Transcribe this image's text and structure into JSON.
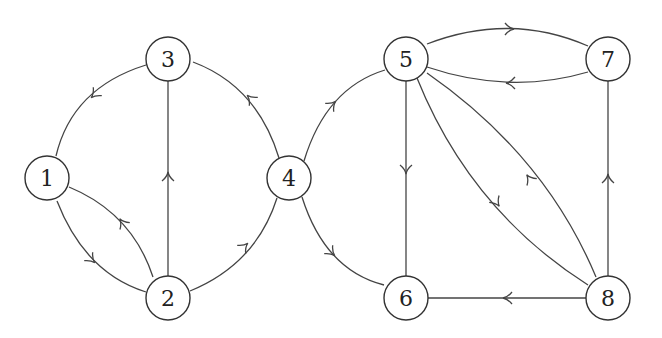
{
  "diagram": {
    "type": "directed-graph",
    "node_radius": 22,
    "stroke_color": "#444444",
    "nodes": [
      {
        "id": "1",
        "label": "1",
        "x": 47,
        "y": 178
      },
      {
        "id": "2",
        "label": "2",
        "x": 168,
        "y": 298
      },
      {
        "id": "3",
        "label": "3",
        "x": 168,
        "y": 59
      },
      {
        "id": "4",
        "label": "4",
        "x": 289,
        "y": 178
      },
      {
        "id": "5",
        "label": "5",
        "x": 406,
        "y": 59
      },
      {
        "id": "6",
        "label": "6",
        "x": 406,
        "y": 298
      },
      {
        "id": "7",
        "label": "7",
        "x": 608,
        "y": 59
      },
      {
        "id": "8",
        "label": "8",
        "x": 608,
        "y": 298
      }
    ],
    "edges": [
      {
        "from": "3",
        "to": "1",
        "path": "M146,65 Q72,88 56,156",
        "arrow": {
          "x": 94,
          "y": 95,
          "angle": 135
        }
      },
      {
        "from": "1",
        "to": "2",
        "path": "M57,201 Q85,273 146,292",
        "arrow": {
          "x": 92,
          "y": 260,
          "angle": 45
        }
      },
      {
        "from": "2",
        "to": "1",
        "path": "M153,277 Q132,213 69,187",
        "arrow": {
          "x": 122,
          "y": 222,
          "angle": 235
        }
      },
      {
        "from": "2",
        "to": "3",
        "path": "M168,276 L168,81",
        "arrow": {
          "x": 168,
          "y": 176,
          "angle": 270
        }
      },
      {
        "from": "2",
        "to": "4",
        "path": "M190,291 Q256,264 277,198",
        "arrow": {
          "x": 245,
          "y": 246,
          "angle": 315
        }
      },
      {
        "from": "4",
        "to": "3",
        "path": "M279,158 Q257,86 193,62",
        "arrow": {
          "x": 250,
          "y": 98,
          "angle": 225
        }
      },
      {
        "from": "4",
        "to": "5",
        "path": "M304,161 Q326,88 385,70",
        "arrow": {
          "x": 333,
          "y": 104,
          "angle": 315
        }
      },
      {
        "from": "4",
        "to": "6",
        "path": "M302,197 Q325,270 384,285",
        "arrow": {
          "x": 332,
          "y": 253,
          "angle": 45
        }
      },
      {
        "from": "5",
        "to": "7",
        "path": "M427,44 Q510,12 588,46",
        "arrow": {
          "x": 510,
          "y": 29,
          "angle": 0
        }
      },
      {
        "from": "7",
        "to": "5",
        "path": "M588,72 Q510,95 427,67",
        "arrow": {
          "x": 510,
          "y": 83,
          "angle": 180
        }
      },
      {
        "from": "5",
        "to": "6",
        "path": "M406,81 L406,276",
        "arrow": {
          "x": 406,
          "y": 170,
          "angle": 90
        }
      },
      {
        "from": "5",
        "to": "8",
        "path": "M417,78 Q470,210 588,285",
        "arrow": {
          "x": 497,
          "y": 203,
          "angle": 55
        }
      },
      {
        "from": "8",
        "to": "5",
        "path": "M596,277 Q545,155 427,73",
        "arrow": {
          "x": 529,
          "y": 178,
          "angle": 235
        }
      },
      {
        "from": "8",
        "to": "7",
        "path": "M608,276 L608,81",
        "arrow": {
          "x": 608,
          "y": 178,
          "angle": 270
        }
      },
      {
        "from": "8",
        "to": "6",
        "path": "M586,298 L428,298",
        "arrow": {
          "x": 507,
          "y": 298,
          "angle": 180
        }
      }
    ]
  }
}
